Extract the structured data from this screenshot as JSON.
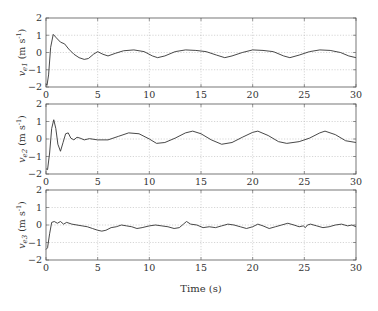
{
  "chart_data": [
    {
      "type": "line",
      "title": "",
      "xlabel": "",
      "ylabel": "v_e1 (m s^-1)",
      "ylabel_main": "v",
      "ylabel_sub": "e1",
      "ylabel_unit": "(m s",
      "ylabel_sup": "-1",
      "ylabel_close": ")",
      "xlim": [
        0,
        30
      ],
      "ylim": [
        -2,
        2
      ],
      "xticks": [
        0,
        5,
        10,
        15,
        20,
        25,
        30
      ],
      "yticks": [
        -2,
        -1,
        0,
        1,
        2
      ],
      "grid": true,
      "series": [
        {
          "name": "v_e1",
          "x": [
            0,
            0.1,
            0.25,
            0.45,
            0.7,
            1.0,
            1.4,
            1.8,
            2.2,
            2.7,
            3.2,
            3.7,
            4.1,
            4.6,
            5.0,
            5.5,
            6.0,
            6.7,
            7.5,
            8.5,
            9.5,
            10.3,
            10.8,
            11.5,
            12.5,
            13.5,
            14.5,
            15.5,
            16.5,
            17.3,
            18.0,
            19.0,
            20.0,
            21.0,
            22.0,
            23.0,
            23.6,
            24.5,
            25.5,
            26.5,
            27.5,
            28.5,
            29.3,
            30
          ],
          "y": [
            -1.8,
            -1.9,
            -1.3,
            0.3,
            1.05,
            0.85,
            0.6,
            0.5,
            0.2,
            -0.1,
            -0.3,
            -0.4,
            -0.35,
            -0.1,
            0.05,
            -0.1,
            -0.2,
            -0.05,
            0.1,
            0.15,
            0.05,
            -0.2,
            -0.3,
            -0.2,
            0.05,
            0.15,
            0.12,
            0.05,
            -0.15,
            -0.3,
            -0.2,
            0.0,
            0.15,
            0.12,
            0.05,
            -0.2,
            -0.3,
            -0.15,
            0.05,
            0.15,
            0.12,
            0.0,
            -0.2,
            -0.3
          ]
        }
      ]
    },
    {
      "type": "line",
      "title": "",
      "xlabel": "",
      "ylabel": "v_e2 (m s^-1)",
      "ylabel_main": "v",
      "ylabel_sub": "e2",
      "ylabel_unit": "(m s",
      "ylabel_sup": "-1",
      "ylabel_close": ")",
      "xlim": [
        0,
        30
      ],
      "ylim": [
        -2,
        2
      ],
      "xticks": [
        0,
        5,
        10,
        15,
        20,
        25,
        30
      ],
      "yticks": [
        -2,
        -1,
        0,
        1,
        2
      ],
      "grid": true,
      "series": [
        {
          "name": "v_e2",
          "x": [
            0,
            0.15,
            0.35,
            0.55,
            0.75,
            0.95,
            1.15,
            1.4,
            1.65,
            1.9,
            2.15,
            2.4,
            2.7,
            3.0,
            3.3,
            3.7,
            4.2,
            5.0,
            6.0,
            7.0,
            8.0,
            9.0,
            10.0,
            10.7,
            11.5,
            12.5,
            13.5,
            14.2,
            15.0,
            16.0,
            17.0,
            18.0,
            19.0,
            20.0,
            20.5,
            21.5,
            22.5,
            23.3,
            24.5,
            25.5,
            26.5,
            27.0,
            28.0,
            29.0,
            30
          ],
          "y": [
            -1.7,
            -1.75,
            -0.8,
            0.6,
            1.1,
            0.6,
            -0.3,
            -0.7,
            -0.2,
            0.3,
            0.35,
            0.05,
            -0.05,
            0.1,
            0.05,
            -0.05,
            0.02,
            -0.05,
            -0.05,
            0.15,
            0.35,
            0.3,
            0.0,
            -0.25,
            -0.2,
            0.05,
            0.35,
            0.45,
            0.3,
            -0.05,
            -0.3,
            -0.2,
            0.1,
            0.38,
            0.45,
            0.2,
            -0.15,
            -0.25,
            -0.15,
            0.05,
            0.35,
            0.45,
            0.25,
            -0.1,
            -0.2
          ]
        }
      ]
    },
    {
      "type": "line",
      "title": "",
      "xlabel": "Time (s)",
      "ylabel": "v_e3 (m s^-1)",
      "ylabel_main": "v",
      "ylabel_sub": "e3",
      "ylabel_unit": "(m s",
      "ylabel_sup": "-1",
      "ylabel_close": ")",
      "xlim": [
        0,
        30
      ],
      "ylim": [
        -2,
        2
      ],
      "xticks": [
        0,
        5,
        10,
        15,
        20,
        25,
        30
      ],
      "yticks": [
        -2,
        -1,
        0,
        1,
        2
      ],
      "grid": true,
      "series": [
        {
          "name": "v_e3",
          "x": [
            0,
            0.15,
            0.35,
            0.55,
            0.8,
            1.1,
            1.4,
            1.7,
            2.0,
            2.5,
            3.0,
            3.5,
            4.0,
            4.5,
            5.0,
            5.4,
            5.8,
            6.3,
            6.8,
            7.3,
            7.8,
            8.3,
            8.8,
            9.3,
            10.0,
            10.6,
            11.2,
            11.8,
            12.4,
            12.9,
            13.3,
            13.6,
            14.0,
            14.6,
            15.2,
            15.8,
            16.4,
            17.0,
            17.6,
            18.2,
            18.8,
            19.4,
            20.0,
            20.5,
            21.0,
            21.6,
            22.2,
            22.8,
            23.4,
            24.0,
            24.5,
            24.9,
            25.1,
            25.3,
            25.6,
            26.2,
            26.8,
            27.4,
            28.0,
            28.6,
            29.2,
            29.6,
            30
          ],
          "y": [
            -1.4,
            -1.3,
            -0.5,
            0.15,
            0.2,
            0.1,
            0.2,
            0.05,
            0.15,
            0.05,
            0.0,
            -0.05,
            -0.1,
            -0.2,
            -0.3,
            -0.35,
            -0.3,
            -0.15,
            -0.1,
            0.0,
            -0.05,
            -0.1,
            -0.2,
            -0.15,
            -0.05,
            0.0,
            -0.05,
            -0.1,
            -0.2,
            -0.15,
            0.05,
            0.2,
            0.05,
            0.0,
            -0.15,
            -0.1,
            -0.15,
            -0.05,
            0.05,
            0.0,
            -0.1,
            -0.2,
            -0.1,
            0.05,
            -0.05,
            -0.2,
            -0.1,
            0.0,
            0.1,
            0.0,
            -0.1,
            -0.05,
            -0.15,
            0.0,
            0.05,
            -0.05,
            -0.15,
            -0.1,
            0.0,
            0.05,
            -0.05,
            0.0,
            -0.1
          ]
        }
      ]
    }
  ],
  "figure": {
    "xlabel": "Time (s)",
    "line_color": "#333333",
    "axis_color": "#555555",
    "grid_color": "#bbbbbb"
  }
}
